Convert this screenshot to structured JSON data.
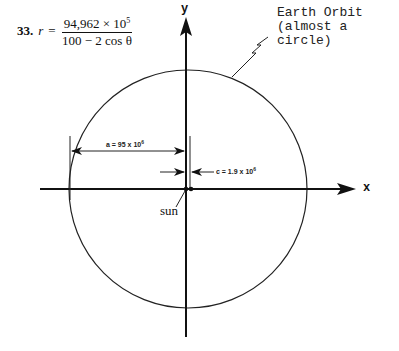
{
  "problem": {
    "number": "33.",
    "variable": "r",
    "equals": "=",
    "numerator_base": "94,962 × 10",
    "numerator_exp": "5",
    "denominator": "100 − 2 cos θ"
  },
  "labels": {
    "orbit_line1": "Earth Orbit",
    "orbit_line2": "(almost a circle)",
    "y_axis": "y",
    "x_axis": "x",
    "sun": "sun",
    "a_label": "a = 95 x 10",
    "a_exp": "6",
    "c_label": "c = 1.9 x 10",
    "c_exp": "6"
  },
  "icons": {
    "y_arrow": "arrowhead-up-icon",
    "x_arrow": "arrowhead-right-icon",
    "dimension_arrows": "dimension-arrow-icon",
    "leader": "zigzag-leader-icon"
  },
  "colors": {
    "ink": "#111111",
    "background": "#ffffff"
  }
}
